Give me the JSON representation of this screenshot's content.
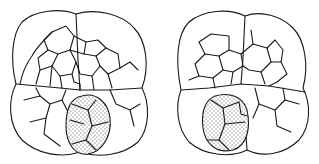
{
  "figure": {
    "panels": [
      {
        "id": "left",
        "stippled_region": "lower-center-right"
      },
      {
        "id": "right",
        "stippled_region": "lower-left"
      }
    ],
    "colors": {
      "line": "#1a1a1a",
      "background": "#ffffff",
      "stipple": "#333333"
    }
  }
}
